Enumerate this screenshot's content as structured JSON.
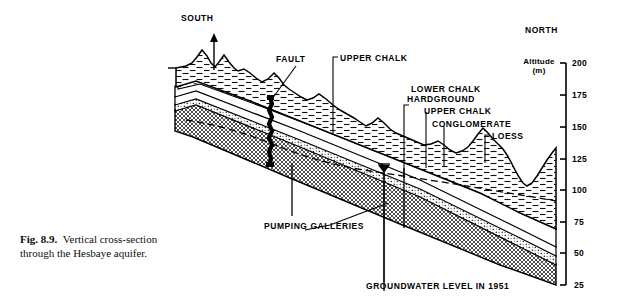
{
  "figure": {
    "caption_label": "Fig. 8.9.",
    "caption_text": "Vertical cross-section through the Hesbaye aquifer."
  },
  "orientation": {
    "south": "SOUTH",
    "north": "NORTH"
  },
  "axis": {
    "title_line1": "Altitude",
    "title_line2": "(m)",
    "ticks": [
      "200",
      "175",
      "150",
      "125",
      "100",
      "75",
      "50",
      "25"
    ],
    "max": 200,
    "min": 25,
    "step": 25
  },
  "labels": {
    "fault": "FAULT",
    "upper_chalk_left": "UPPER CHALK",
    "lower_chalk": "LOWER CHALK",
    "hardground": "HARDGROUND",
    "upper_chalk_right": "UPPER CHALK",
    "conglomerate": "CONGLOMERATE",
    "loess": "LOESS",
    "pumping_galleries": "PUMPING GALLERIES",
    "groundwater_level": "GROUNDWATER LEVEL IN 1951"
  },
  "colors": {
    "ink": "#000000",
    "paper": "#ffffff",
    "hatch": "#1a1a1a",
    "stipple": "#555555"
  }
}
